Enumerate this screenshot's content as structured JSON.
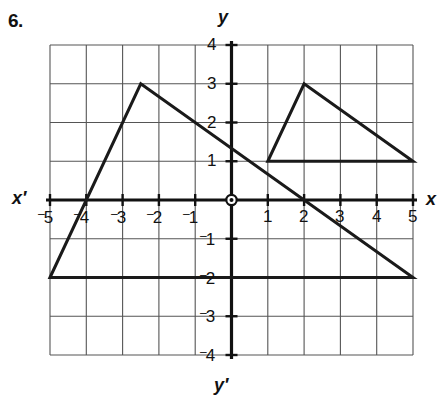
{
  "problem": {
    "number": "6."
  },
  "axes": {
    "x_label": "x",
    "x_prime_label": "x′",
    "y_label": "y",
    "y_prime_label": "y′",
    "x_ticks": [
      {
        "value": -5,
        "neg": "–",
        "text": "5"
      },
      {
        "value": -4,
        "neg": "–",
        "text": "4"
      },
      {
        "value": -3,
        "neg": "–",
        "text": "3"
      },
      {
        "value": -2,
        "neg": "–",
        "text": "2"
      },
      {
        "value": -1,
        "neg": "–",
        "text": "1"
      },
      {
        "value": 1,
        "neg": "",
        "text": "1"
      },
      {
        "value": 2,
        "neg": "",
        "text": "2"
      },
      {
        "value": 3,
        "neg": "",
        "text": "3"
      },
      {
        "value": 4,
        "neg": "",
        "text": "4"
      },
      {
        "value": 5,
        "neg": "",
        "text": "5"
      }
    ],
    "y_ticks": [
      {
        "value": 4,
        "neg": "",
        "text": "4"
      },
      {
        "value": 3,
        "neg": "",
        "text": "3"
      },
      {
        "value": 2,
        "neg": "",
        "text": "2"
      },
      {
        "value": 1,
        "neg": "",
        "text": "1"
      },
      {
        "value": -1,
        "neg": "–",
        "text": "1"
      },
      {
        "value": -2,
        "neg": "–",
        "text": "2"
      },
      {
        "value": -3,
        "neg": "–",
        "text": "3"
      },
      {
        "value": -4,
        "neg": "–",
        "text": "4"
      }
    ],
    "origin_marker": "circled-dot"
  },
  "chart_data": {
    "type": "diagram",
    "title": "",
    "xlabel": "x",
    "ylabel": "y",
    "xlim": [
      -5,
      5
    ],
    "ylim": [
      -4,
      4
    ],
    "grid": true,
    "grid_step": 1,
    "shapes": [
      {
        "name": "large-triangle",
        "type": "polygon",
        "vertices": [
          [
            -5,
            -2
          ],
          [
            -2.5,
            3
          ],
          [
            5,
            -2
          ]
        ],
        "stroke": "#1a1a1a",
        "stroke_width": 3,
        "fill": "none"
      },
      {
        "name": "small-triangle",
        "type": "polygon",
        "vertices": [
          [
            1,
            1
          ],
          [
            2,
            3
          ],
          [
            5,
            1
          ]
        ],
        "stroke": "#1a1a1a",
        "stroke_width": 3,
        "fill": "none"
      }
    ]
  },
  "colors": {
    "ink": "#1a1a1a",
    "grid": "#555555",
    "axis": "#111111",
    "background": "#ffffff"
  }
}
